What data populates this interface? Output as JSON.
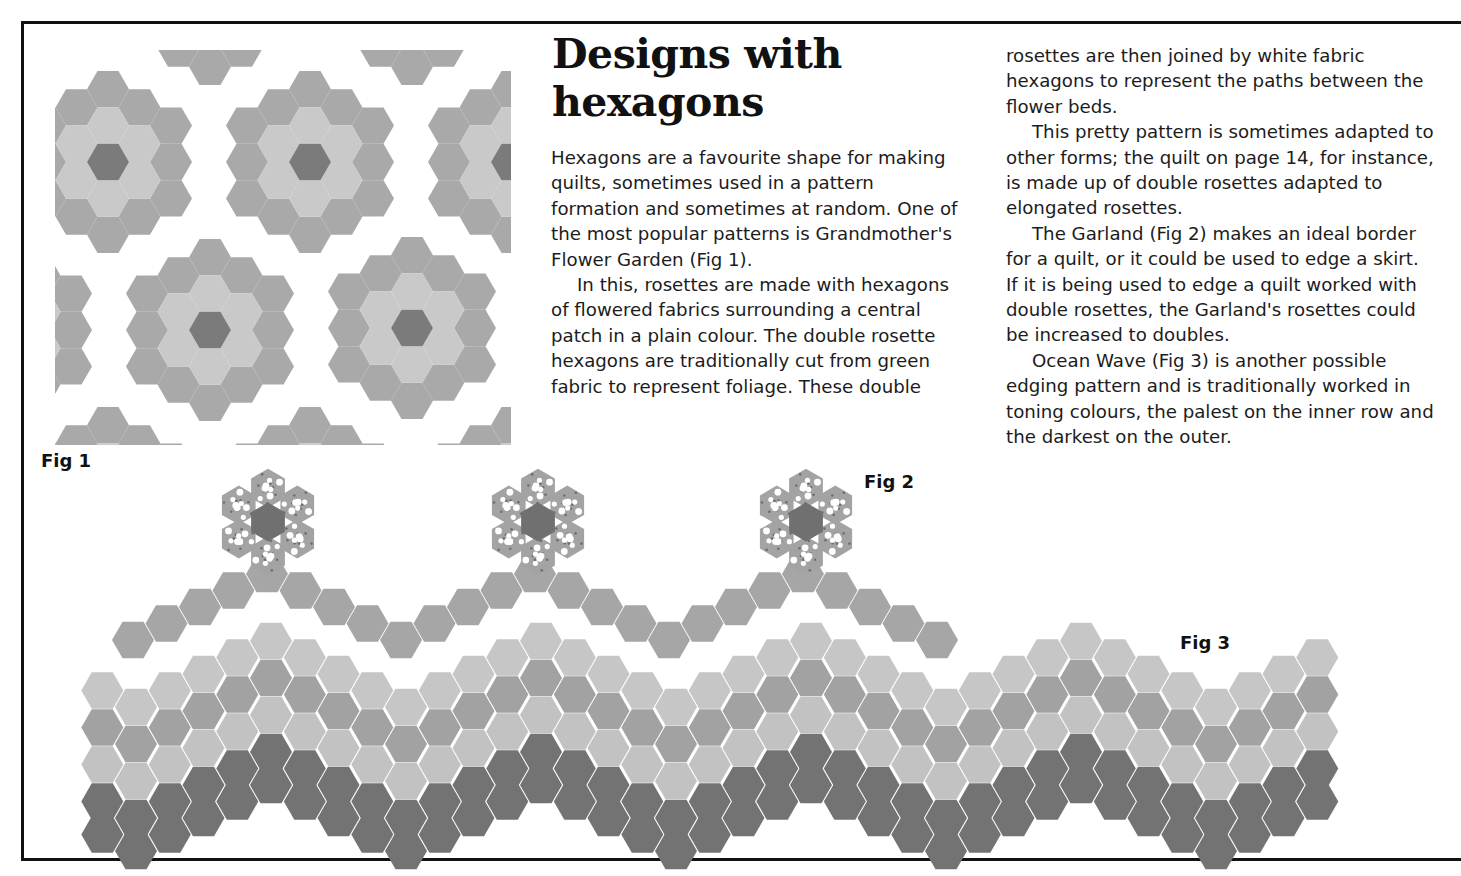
{
  "article": {
    "title_line1": "Designs with",
    "title_line2": "hexagons",
    "column1": [
      "Hexagons are a favourite shape for making quilts, sometimes used in a pattern formation and sometimes at random. One of the most popular patterns is Grandmother's Flower Garden (Fig 1).",
      "In this, rosettes are made with hexagons of flowered fabrics surrounding a central patch in a plain colour. The double rosette hexagons are traditionally cut from green fabric to represent foliage. These double"
    ],
    "column2": [
      "rosettes are then joined by white fabric hexagons to represent the paths between the flower beds.",
      "This pretty pattern is sometimes adapted to other forms; the quilt on page 14, for instance, is made up of double rosettes adapted to elongated rosettes.",
      "The Garland (Fig 2) makes an ideal border for a quilt, or it could be used to edge a skirt. If it is being used to edge a quilt worked with double rosettes, the Garland's rosettes could be increased to doubles.",
      "Ocean Wave (Fig 3) is another possible edging pattern and is traditionally worked in toning colours, the palest on the inner row and the darkest on the outer."
    ]
  },
  "figures": {
    "fig1": {
      "label": "Fig 1",
      "name": "Grandmother's Flower Garden",
      "colors": {
        "outer_ring": "#a9a9a9",
        "inner_ring": "#c9c9c9",
        "center": "#7b7b7b",
        "path": "#ffffff"
      },
      "rosette_centers": [
        [
          108,
          162
        ],
        [
          310,
          162
        ],
        [
          512,
          162
        ],
        [
          210,
          330
        ],
        [
          412,
          328
        ],
        [
          8,
          330
        ]
      ]
    },
    "fig2": {
      "label": "Fig 2",
      "name": "The Garland",
      "colors": {
        "chain": "#a6a6a6",
        "flowered": "#a3a3a3",
        "center": "#707070",
        "dots": "#ffffff"
      },
      "rosette_centers": [
        [
          268,
          522
        ],
        [
          538,
          522
        ],
        [
          806,
          522
        ]
      ]
    },
    "fig3": {
      "label": "Fig 3",
      "name": "Ocean Wave",
      "rows": [
        {
          "tone": "palest",
          "color": "#c6c6c6"
        },
        {
          "tone": "medium",
          "color": "#a2a2a2"
        },
        {
          "tone": "pale",
          "color": "#c2c2c2"
        },
        {
          "tone": "darkest",
          "color": "#737373"
        }
      ]
    }
  },
  "page": {
    "border_color": "#111111"
  }
}
